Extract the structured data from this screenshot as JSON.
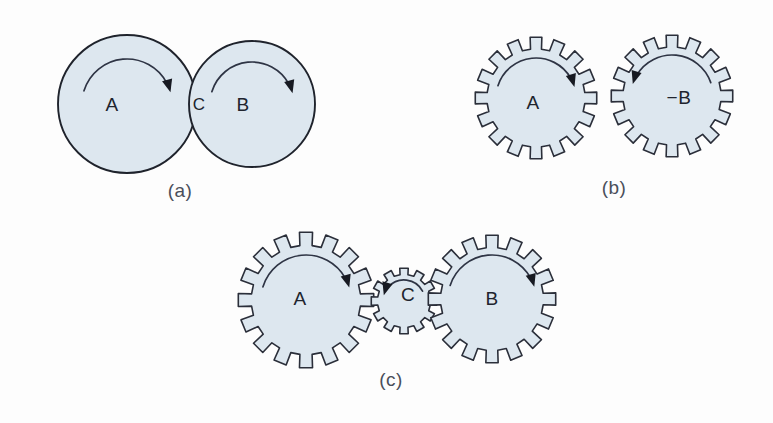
{
  "figure": {
    "background_color": "#fdfdfd",
    "gear_fill_color": "#dde7ef",
    "gear_stroke_color": "#2b2f3a",
    "arrow_color": "#171a22",
    "label_color": "#20242e",
    "caption_color": "#4a4f5a"
  },
  "panels": [
    {
      "id": "a",
      "caption": "(a)",
      "caption_x": 180,
      "caption_y": 192,
      "type": "friction-wheels",
      "parts": [
        {
          "name": "wheel-a",
          "label": "A",
          "label_x": 112,
          "label_y": 106,
          "cx": 127,
          "cy": 104,
          "r": 69,
          "teeth": 0,
          "rotation": "clockwise",
          "arc_r": 45,
          "arc_start_deg": 197,
          "arc_end_deg": 345
        },
        {
          "name": "wheel-b",
          "label": "B",
          "label_x": 243,
          "label_y": 106,
          "cx": 252,
          "cy": 104,
          "r": 63,
          "teeth": 0,
          "rotation": "clockwise",
          "arc_r": 42,
          "arc_start_deg": 197,
          "arc_end_deg": 345
        }
      ],
      "annotations": [
        {
          "name": "contact-point-label",
          "text": "C",
          "x": 199,
          "y": 106
        }
      ]
    },
    {
      "id": "b",
      "caption": "(b)",
      "caption_x": 614,
      "caption_y": 189,
      "type": "gear-pair",
      "parts": [
        {
          "name": "gear-a",
          "label": "A",
          "label_x": 533,
          "label_y": 104,
          "cx": 536,
          "cy": 98,
          "r": 61,
          "teeth": 16,
          "rotation": "clockwise",
          "arc_r": 40,
          "arc_start_deg": 198,
          "arc_end_deg": 344
        },
        {
          "name": "gear-b",
          "label": "−B",
          "label_x": 679,
          "label_y": 99,
          "cx": 672,
          "cy": 96,
          "r": 61,
          "teeth": 16,
          "rotation": "counter-clockwise",
          "arc_r": 41,
          "arc_start_deg": 341,
          "arc_end_deg": 197
        }
      ],
      "annotations": []
    },
    {
      "id": "c",
      "caption": "(c)",
      "caption_x": 391,
      "caption_y": 381,
      "type": "gear-train",
      "parts": [
        {
          "name": "gear-a",
          "label": "A",
          "label_x": 300,
          "label_y": 300,
          "cx": 306,
          "cy": 300,
          "r": 68,
          "teeth": 16,
          "rotation": "clockwise",
          "arc_r": 45,
          "arc_start_deg": 197,
          "arc_end_deg": 344
        },
        {
          "name": "gear-c",
          "label": "C",
          "label_x": 408,
          "label_y": 296,
          "cx": 404,
          "cy": 301,
          "r": 33,
          "teeth": 12,
          "rotation": "counter-clockwise",
          "arc_r": 21,
          "arc_start_deg": 332,
          "arc_end_deg": 196
        },
        {
          "name": "gear-b",
          "label": "B",
          "label_x": 492,
          "label_y": 300,
          "cx": 492,
          "cy": 299,
          "r": 64,
          "teeth": 16,
          "rotation": "clockwise",
          "arc_r": 44,
          "arc_start_deg": 198,
          "arc_end_deg": 344
        }
      ],
      "annotations": []
    }
  ]
}
